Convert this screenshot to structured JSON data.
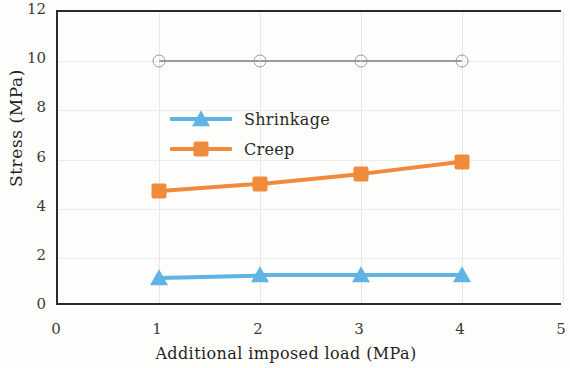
{
  "figure": {
    "background": "#fdfdfb",
    "axis_color": "#2b2b2b",
    "grid_color": "#e9e7e3"
  },
  "axes": {
    "y_title": "Stress (MPa)",
    "x_title": "Additional imposed load (MPa)",
    "y_ticks": [
      "0",
      "2",
      "4",
      "6",
      "8",
      "10",
      "12"
    ],
    "x_ticks": [
      "0",
      "1",
      "2",
      "3",
      "4",
      "5"
    ]
  },
  "legend": {
    "entries": [
      {
        "label": "Shrinkage",
        "color": "#5fb4e5",
        "marker": "triangle-marker"
      },
      {
        "label": "Creep",
        "color": "#f08a3c",
        "marker": "square-marker"
      }
    ]
  },
  "chart_data": {
    "type": "line",
    "title": "",
    "xlabel": "Additional imposed load (MPa)",
    "ylabel": "Stress (MPa)",
    "xlim": [
      0,
      5
    ],
    "ylim": [
      0,
      12
    ],
    "xticks": [
      0,
      1,
      2,
      3,
      4,
      5
    ],
    "yticks": [
      0,
      2,
      4,
      6,
      8,
      10,
      12
    ],
    "grid": true,
    "legend_position": "upper-left-inside",
    "x": [
      1,
      2,
      3,
      4
    ],
    "series": [
      {
        "name": "",
        "legend_shown": false,
        "color": "#9a9a9a",
        "marker": "open-circle",
        "values": [
          10.0,
          10.0,
          10.0,
          10.0
        ]
      },
      {
        "name": "Creep",
        "legend_shown": true,
        "color": "#f08a3c",
        "marker": "square",
        "values": [
          4.7,
          5.0,
          5.4,
          5.9
        ]
      },
      {
        "name": "Shrinkage",
        "legend_shown": true,
        "color": "#5fb4e5",
        "marker": "triangle",
        "values": [
          1.2,
          1.3,
          1.3,
          1.3
        ]
      }
    ]
  }
}
